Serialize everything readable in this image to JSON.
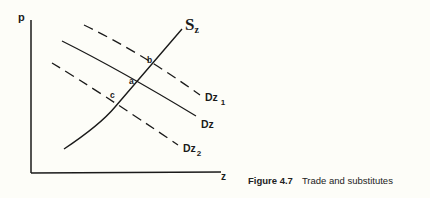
{
  "figure": {
    "caption_number": "Figure 4.7",
    "caption_title": "Trade and substitutes"
  },
  "axes": {
    "y_label": "p",
    "x_label": "z"
  },
  "curves": {
    "supply": {
      "label": "S",
      "subscript": "z",
      "style": "solid"
    },
    "demand": {
      "label": "Dz",
      "style": "solid"
    },
    "demand_1": {
      "label": "Dz",
      "subscript": "1",
      "style": "dashed"
    },
    "demand_2": {
      "label": "Dz",
      "subscript": "2",
      "style": "dashed"
    }
  },
  "points": {
    "a": "a",
    "b": "b",
    "c": "c"
  },
  "colors": {
    "ink": "#1a1a1a",
    "background": "#fdfdf8"
  }
}
